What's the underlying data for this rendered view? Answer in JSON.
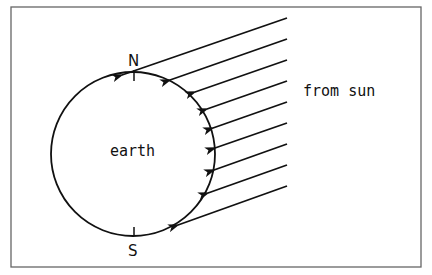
{
  "diagram": {
    "labels": {
      "north": "N",
      "south": "S",
      "planet": "earth",
      "source": "from sun"
    },
    "colors": {
      "stroke": "#111111",
      "frame": "#555555",
      "background": "#ffffff"
    },
    "earth": {
      "cx": 133,
      "cy": 154,
      "r": 82
    },
    "ray_count": 9
  }
}
